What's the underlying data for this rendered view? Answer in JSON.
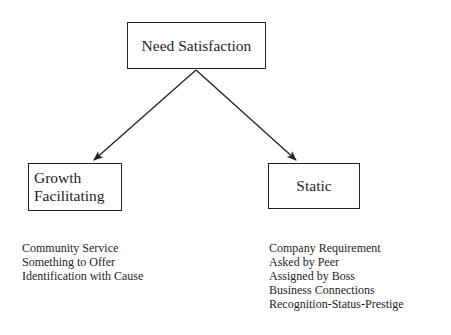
{
  "diagram": {
    "root": {
      "label": "Need Satisfaction"
    },
    "branches": [
      {
        "label_lines": [
          "Growth",
          "Facilitating"
        ],
        "items": [
          "Community Service",
          "Something to Offer",
          "Identification with Cause"
        ]
      },
      {
        "label": "Static",
        "items": [
          "Company Requirement",
          "Asked by Peer",
          "Assigned by Boss",
          "Business Connections",
          "Recognition-Status-Prestige"
        ]
      }
    ],
    "edges": [
      {
        "from": "Need Satisfaction",
        "to": "Growth Facilitating"
      },
      {
        "from": "Need Satisfaction",
        "to": "Static"
      }
    ],
    "colors": {
      "line": "#222222",
      "text": "#1e1e1e",
      "background": "#ffffff"
    }
  }
}
